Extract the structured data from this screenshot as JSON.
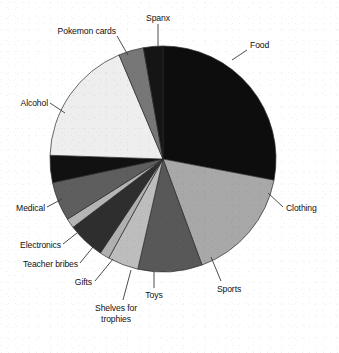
{
  "chart_data": {
    "type": "pie",
    "title": "",
    "subtitle": "",
    "xlabel": "",
    "ylabel": "",
    "legend_position": "none",
    "labels_position": "outside-with-leader-lines",
    "grid": false,
    "start_angle_deg": 0,
    "direction": "clockwise",
    "center": {
      "x": 163,
      "y": 159
    },
    "radius": 113,
    "categories": [
      "Food",
      "Clothing",
      "Sports",
      "Toys",
      "Shelves for trophies",
      "Gifts",
      "Teacher bribes",
      "Electronics",
      "Medical",
      "Alcohol",
      "Pokemon cards",
      "Spanx"
    ],
    "values": [
      28.0,
      16.4,
      9.2,
      4.4,
      1.4,
      5.3,
      1.4,
      5.6,
      3.9,
      18.1,
      3.6,
      2.7
    ],
    "value_unit": "percent",
    "slices": [
      {
        "label": "Food",
        "value": 28.0,
        "start_deg": 0.0,
        "end_deg": 100.8,
        "color": "#0d0d0d"
      },
      {
        "label": "Clothing",
        "value": 16.4,
        "start_deg": 100.8,
        "end_deg": 159.8,
        "color": "#a8a8a8"
      },
      {
        "label": "Sports",
        "value": 9.2,
        "start_deg": 159.8,
        "end_deg": 192.9,
        "color": "#585858"
      },
      {
        "label": "Toys",
        "value": 4.4,
        "start_deg": 192.9,
        "end_deg": 208.7,
        "color": "#bdbdbd"
      },
      {
        "label": "Shelves for trophies",
        "value": 1.4,
        "start_deg": 208.7,
        "end_deg": 213.7,
        "color": "#b0b0b0"
      },
      {
        "label": "Gifts",
        "value": 5.3,
        "start_deg": 213.7,
        "end_deg": 232.8,
        "color": "#2e2e2e"
      },
      {
        "label": "Teacher bribes",
        "value": 1.4,
        "start_deg": 232.8,
        "end_deg": 237.8,
        "color": "#b5b5b5"
      },
      {
        "label": "Electronics",
        "value": 5.6,
        "start_deg": 237.8,
        "end_deg": 257.9,
        "color": "#5e5e5e"
      },
      {
        "label": "Medical",
        "value": 3.9,
        "start_deg": 257.9,
        "end_deg": 271.9,
        "color": "#111111"
      },
      {
        "label": "Alcohol",
        "value": 18.1,
        "start_deg": 271.9,
        "end_deg": 337.1,
        "color": "#eeeeee"
      },
      {
        "label": "Pokemon cards",
        "value": 3.6,
        "start_deg": 337.1,
        "end_deg": 350.0,
        "color": "#777777"
      },
      {
        "label": "Spanx",
        "value": 2.7,
        "start_deg": 350.0,
        "end_deg": 360.0,
        "color": "#151515"
      }
    ]
  },
  "labels": {
    "food": "Food",
    "clothing": "Clothing",
    "sports": "Sports",
    "toys": "Toys",
    "shelves_line1": "Shelves for",
    "shelves_line2": "trophies",
    "gifts": "Gifts",
    "teacher_bribes": "Teacher bribes",
    "electronics": "Electronics",
    "medical": "Medical",
    "alcohol": "Alcohol",
    "pokemon_cards": "Pokemon cards",
    "spanx": "Spanx"
  },
  "colors": {
    "background": "#ffffff",
    "outline": "#2b2b2b",
    "text": "#111111",
    "leader_line": "#3a3a3a"
  }
}
